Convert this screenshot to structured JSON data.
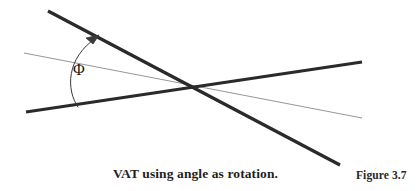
{
  "figure": {
    "caption": "VAT using angle as rotation.",
    "label": "Figure 3.7",
    "angle_symbol": "Φ",
    "background_color": "#ffffff",
    "thick_line_color": "#2a2a2a",
    "thin_line_color": "#8a8a8a",
    "arc_color": "#3a3a3a",
    "text_color": "#1f1f1f",
    "thick_line_width": 3.2,
    "thin_line_width": 0.9,
    "arc_line_width": 1.0,
    "intersection": {
      "x": 190,
      "y": 88
    },
    "elements": {
      "thick_rotated_line_name": "thick-rotated-line",
      "thick_reference_line_name": "thick-reference-line",
      "thin_reference_line_name": "thin-reference-line",
      "angle_arc_name": "angle-arc-arrow"
    },
    "lines": [
      {
        "name": "thick-rotated-line",
        "style": "thick",
        "x1": 48,
        "y1": 11,
        "x2": 340,
        "y2": 165
      },
      {
        "name": "thick-reference-line",
        "style": "thick",
        "x1": 26,
        "y1": 112,
        "x2": 362,
        "y2": 62
      },
      {
        "name": "thin-reference-line",
        "style": "thin",
        "x1": 24,
        "y1": 53,
        "x2": 362,
        "y2": 118
      }
    ],
    "arc": {
      "name": "angle-arc-arrow",
      "start": {
        "x": 78,
        "y": 107
      },
      "end": {
        "x": 96,
        "y": 38
      },
      "control": {
        "x": 66,
        "y": 66
      },
      "arrow_tip": {
        "x": 98,
        "y": 36
      }
    }
  }
}
